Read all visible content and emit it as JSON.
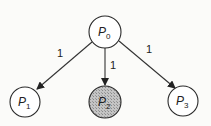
{
  "diagram": {
    "type": "directed-graph",
    "nodes": [
      {
        "id": "P0",
        "label": "P",
        "subscript": "0",
        "shaded": false
      },
      {
        "id": "P1",
        "label": "P",
        "subscript": "1",
        "shaded": false
      },
      {
        "id": "P2",
        "label": "P",
        "subscript": "2",
        "shaded": true
      },
      {
        "id": "P3",
        "label": "P",
        "subscript": "3",
        "shaded": false
      }
    ],
    "edges": [
      {
        "from": "P0",
        "to": "P1",
        "weight": "1"
      },
      {
        "from": "P0",
        "to": "P2",
        "weight": "1"
      },
      {
        "from": "P0",
        "to": "P3",
        "weight": "1"
      }
    ],
    "colors": {
      "node_fill": "#ffffff",
      "shaded_fill": "#b8b8b8",
      "stroke": "#2a2a2a",
      "background": "#fbfbf9"
    }
  }
}
